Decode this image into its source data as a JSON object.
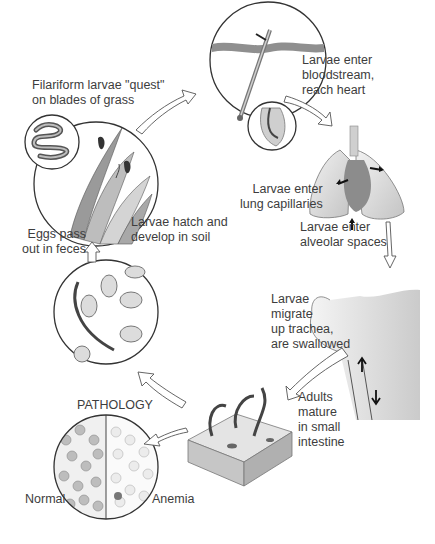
{
  "diagram": {
    "type": "life-cycle",
    "stages": [
      {
        "id": "quest",
        "label": "Filariform larvae \"quest\"\non blades of grass",
        "icon": "grass-larvae-icon"
      },
      {
        "id": "skin",
        "label": "",
        "icon": "skin-penetration-icon"
      },
      {
        "id": "blood",
        "label": "Larvae enter\nbloodstream,\nreach heart",
        "icon": "arrow-icon"
      },
      {
        "id": "lungcap",
        "label": "Larvae enter\nlung capillaries",
        "icon": "lungs-heart-icon"
      },
      {
        "id": "alveolar",
        "label": "Larvae enter\nalveolar spaces",
        "icon": "arrow-down-icon"
      },
      {
        "id": "trachea",
        "label": "Larvae\nmigrate\nup trachea,\nare swallowed",
        "icon": "throat-trachea-icon"
      },
      {
        "id": "adults",
        "label": "Adults\nmature\nin small\nintestine",
        "icon": "intestine-worms-icon"
      },
      {
        "id": "eggs",
        "label": "Eggs pass\nout in feces",
        "icon": "eggs-microscope-icon"
      },
      {
        "id": "hatch",
        "label": "Larvae hatch and\ndevelop in soil",
        "icon": "grass-larvae-icon"
      }
    ],
    "pathology": {
      "title": "PATHOLOGY",
      "left_label": "Normal",
      "right_label": "Anemia"
    },
    "colors": {
      "line": "#4a4a4a",
      "text": "#3d3d3d",
      "fill_light": "#e6e6e6",
      "fill_mid": "#b5b5b5",
      "fill_dark": "#6e6e6e"
    }
  }
}
